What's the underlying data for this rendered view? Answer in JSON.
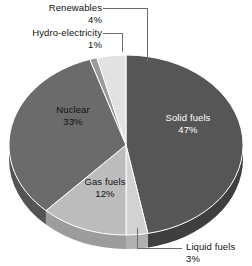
{
  "chart_data": {
    "type": "pie",
    "title": "",
    "subtitle": "",
    "xlabel": "",
    "ylabel": "",
    "legend_position": "none",
    "grid": false,
    "three_d": true,
    "start_angle_deg": 0,
    "direction": "clockwise",
    "units": "percent",
    "categories": [
      "Solid fuels",
      "Liquid fuels",
      "Gas fuels",
      "Nuclear",
      "Hydro-electricity",
      "Renewables"
    ],
    "values": [
      47,
      3,
      12,
      33,
      1,
      4
    ],
    "slices": [
      {
        "label": "Solid fuels",
        "value": 47,
        "value_text": "47%",
        "color": "#565656",
        "side_color": "#3f3f3f",
        "label_placement": "inside",
        "label_color": "#ffffff"
      },
      {
        "label": "Liquid fuels",
        "value": 3,
        "value_text": "3%",
        "color": "#d2d2d2",
        "side_color": "#b0b0b0",
        "label_placement": "outside",
        "label_color": "#111111"
      },
      {
        "label": "Gas fuels",
        "value": 12,
        "value_text": "12%",
        "color": "#bcbcbc",
        "side_color": "#9c9c9c",
        "label_placement": "inside",
        "label_color": "#111111"
      },
      {
        "label": "Nuclear",
        "value": 33,
        "value_text": "33%",
        "color": "#6b6b6b",
        "side_color": "#545454",
        "label_placement": "inside",
        "label_color": "#111111"
      },
      {
        "label": "Hydro-electricity",
        "value": 1,
        "value_text": "1%",
        "color": "#9a9a9a",
        "side_color": "#7d7d7d",
        "label_placement": "outside",
        "label_color": "#111111"
      },
      {
        "label": "Renewables",
        "value": 4,
        "value_text": "4%",
        "color": "#e2e2e2",
        "side_color": "#c0c0c0",
        "label_placement": "outside",
        "label_color": "#111111"
      }
    ],
    "colors": {
      "background": "#ffffff",
      "leader_line": "#6e6e6e",
      "text": "#111111",
      "text_on_dark": "#ffffff"
    }
  }
}
